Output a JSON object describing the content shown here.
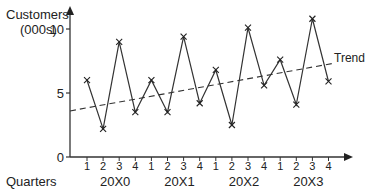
{
  "chart_data": {
    "type": "line",
    "title": "",
    "ylabel": "Customers (000s)",
    "ylabel_lines": [
      "Customers",
      "(000s)"
    ],
    "xlabel": "Quarters",
    "ylim": [
      0,
      11
    ],
    "yticks": [
      0,
      5,
      10
    ],
    "quarters": [
      "1",
      "2",
      "3",
      "4",
      "1",
      "2",
      "3",
      "4",
      "1",
      "2",
      "3",
      "4",
      "1",
      "2",
      "3",
      "4"
    ],
    "years": [
      "20X0",
      "20X1",
      "20X2",
      "20X3"
    ],
    "grid": false,
    "series": [
      {
        "name": "Customers",
        "marker": "x",
        "values": [
          6.0,
          2.2,
          9.0,
          3.5,
          6.0,
          3.5,
          9.4,
          4.2,
          6.8,
          2.5,
          10.1,
          5.6,
          7.6,
          4.1,
          10.8,
          5.9
        ]
      },
      {
        "name": "Trend",
        "style": "dashed",
        "start": 3.6,
        "end": 7.3
      }
    ],
    "annotations": [
      "Trend"
    ]
  }
}
